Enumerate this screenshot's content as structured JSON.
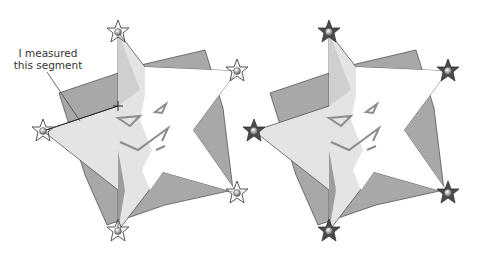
{
  "annotation": {
    "line1": "I measured",
    "line2": "this segment"
  },
  "panels": [
    {
      "name": "left-figure",
      "handle_style": "outline-star"
    },
    {
      "name": "right-figure",
      "handle_style": "filled-star"
    }
  ],
  "colors": {
    "square": "#9a9a9a",
    "star_light": "#e2e2e2",
    "star_shadow": "#c4c4c4",
    "star_white": "#ffffff",
    "outline": "#444444",
    "face": "#8c8c8c",
    "handle_dark": "#4a4a4a"
  }
}
